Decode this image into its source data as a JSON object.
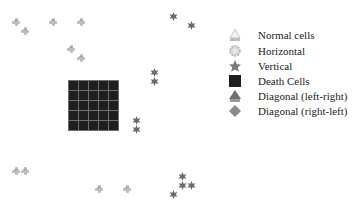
{
  "legend": {
    "items": [
      {
        "icon": "normal-cell-icon",
        "label": "Normal cells"
      },
      {
        "icon": "horizontal-icon",
        "label": "Horizontal"
      },
      {
        "icon": "vertical-star-icon",
        "label": "Vertical"
      },
      {
        "icon": "death-cell-icon",
        "label": "Death Cells"
      },
      {
        "icon": "diagonal-left-right-icon",
        "label": "Diagonal (left-right)"
      },
      {
        "icon": "diagonal-right-left-icon",
        "label": "Diagonal (right-left)"
      }
    ]
  },
  "colors": {
    "normal": "#bdbdbd",
    "star": "#6a6a6a",
    "death": "#1e1e1e",
    "grid_line": "#6f6f6f"
  },
  "cells": {
    "normal": [
      [
        16,
        22
      ],
      [
        25,
        31
      ],
      [
        53,
        22
      ],
      [
        81,
        22
      ],
      [
        71,
        49
      ],
      [
        81,
        58
      ],
      [
        16,
        171
      ],
      [
        25,
        171
      ],
      [
        99,
        189
      ],
      [
        127,
        189
      ]
    ],
    "vertical": [
      [
        173,
        11
      ],
      [
        191,
        20
      ],
      [
        154,
        67
      ],
      [
        154,
        76
      ],
      [
        136,
        115
      ],
      [
        136,
        124
      ],
      [
        182,
        171
      ],
      [
        182,
        180
      ],
      [
        191,
        180
      ],
      [
        173,
        189
      ]
    ],
    "death_grid": {
      "x": 68,
      "y": 80,
      "rows": 5,
      "cols": 5
    }
  }
}
